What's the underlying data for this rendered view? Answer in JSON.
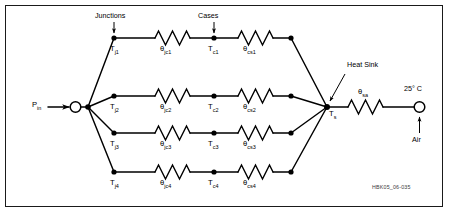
{
  "figure": {
    "type": "thermal-resistance-network-schematic",
    "reference_id": "HBK05_06-035",
    "border_color": "#1a1a1a",
    "line_color": "#000000",
    "background": "#ffffff"
  },
  "annotations": {
    "junctions": "Junctions",
    "cases": "Cases",
    "heat_sink": "Heat Sink",
    "ambient_temp": "25° C",
    "air": "Air"
  },
  "source": {
    "power_label": "P",
    "power_sub": "in"
  },
  "sink": {
    "label": "T",
    "sub": "s"
  },
  "branches": [
    {
      "junction": {
        "label": "T",
        "sub": "j1"
      },
      "theta_jc": {
        "label": "θ",
        "sub": "jc1"
      },
      "case": {
        "label": "T",
        "sub": "c1"
      },
      "theta_cs": {
        "label": "θ",
        "sub": "cs1"
      }
    },
    {
      "junction": {
        "label": "T",
        "sub": "j2"
      },
      "theta_jc": {
        "label": "θ",
        "sub": "jc2"
      },
      "case": {
        "label": "T",
        "sub": "c2"
      },
      "theta_cs": {
        "label": "θ",
        "sub": "cs2"
      }
    },
    {
      "junction": {
        "label": "T",
        "sub": "j3"
      },
      "theta_jc": {
        "label": "θ",
        "sub": "jc3"
      },
      "case": {
        "label": "T",
        "sub": "c3"
      },
      "theta_cs": {
        "label": "θ",
        "sub": "cs3"
      }
    },
    {
      "junction": {
        "label": "T",
        "sub": "j4"
      },
      "theta_jc": {
        "label": "θ",
        "sub": "jc4"
      },
      "case": {
        "label": "T",
        "sub": "c4"
      },
      "theta_cs": {
        "label": "θ",
        "sub": "cs4"
      }
    }
  ],
  "sink_to_air": {
    "theta_sa": {
      "label": "θ",
      "sub": "sa"
    }
  }
}
